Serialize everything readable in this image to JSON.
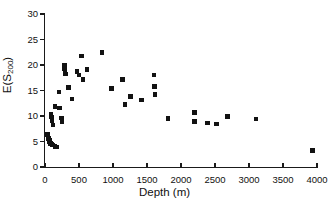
{
  "chart_data": {
    "type": "scatter",
    "title": "",
    "xlabel": "Depth (m)",
    "ylabel": "E(S200)",
    "ylabel_base": "E(S",
    "ylabel_sub": "200",
    "ylabel_close": ")",
    "xlim": [
      0,
      4000
    ],
    "ylim": [
      0,
      30
    ],
    "xticks": [
      0,
      500,
      1000,
      1500,
      2000,
      2500,
      3000,
      3500,
      4000
    ],
    "yticks": [
      0,
      5,
      10,
      15,
      20,
      25,
      30
    ],
    "grid": false,
    "legend": null,
    "marker": "square",
    "marker_color": "#121212",
    "points": [
      {
        "x": 40,
        "y": 6.4
      },
      {
        "x": 55,
        "y": 5.6
      },
      {
        "x": 62,
        "y": 5.3
      },
      {
        "x": 68,
        "y": 5.0
      },
      {
        "x": 72,
        "y": 4.8
      },
      {
        "x": 80,
        "y": 4.6
      },
      {
        "x": 95,
        "y": 4.5
      },
      {
        "x": 110,
        "y": 4.3
      },
      {
        "x": 150,
        "y": 4.0
      },
      {
        "x": 175,
        "y": 3.9
      },
      {
        "x": 90,
        "y": 10.3
      },
      {
        "x": 95,
        "y": 9.8
      },
      {
        "x": 100,
        "y": 9.4
      },
      {
        "x": 105,
        "y": 9.1
      },
      {
        "x": 120,
        "y": 8.2
      },
      {
        "x": 150,
        "y": 11.9
      },
      {
        "x": 215,
        "y": 11.6
      },
      {
        "x": 240,
        "y": 9.6
      },
      {
        "x": 250,
        "y": 8.9
      },
      {
        "x": 205,
        "y": 14.7
      },
      {
        "x": 285,
        "y": 19.9
      },
      {
        "x": 290,
        "y": 19.3
      },
      {
        "x": 295,
        "y": 18.6
      },
      {
        "x": 300,
        "y": 18.2
      },
      {
        "x": 345,
        "y": 15.6
      },
      {
        "x": 395,
        "y": 13.3
      },
      {
        "x": 470,
        "y": 18.7
      },
      {
        "x": 500,
        "y": 18.0
      },
      {
        "x": 540,
        "y": 21.8
      },
      {
        "x": 560,
        "y": 17.1
      },
      {
        "x": 620,
        "y": 19.1
      },
      {
        "x": 840,
        "y": 22.4
      },
      {
        "x": 975,
        "y": 15.4
      },
      {
        "x": 1140,
        "y": 17.1
      },
      {
        "x": 1175,
        "y": 12.3
      },
      {
        "x": 1255,
        "y": 13.8
      },
      {
        "x": 1420,
        "y": 13.1
      },
      {
        "x": 1600,
        "y": 18.0
      },
      {
        "x": 1610,
        "y": 15.8
      },
      {
        "x": 1620,
        "y": 14.2
      },
      {
        "x": 1810,
        "y": 9.5
      },
      {
        "x": 2195,
        "y": 10.7
      },
      {
        "x": 2200,
        "y": 8.9
      },
      {
        "x": 2390,
        "y": 8.6
      },
      {
        "x": 2520,
        "y": 8.4
      },
      {
        "x": 2680,
        "y": 9.9
      },
      {
        "x": 3100,
        "y": 9.4
      },
      {
        "x": 3930,
        "y": 3.2
      }
    ]
  }
}
